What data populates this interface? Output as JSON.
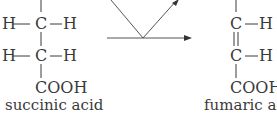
{
  "left_molecule": {
    "row1": {
      "left": "H",
      "center": "C",
      "right": "H"
    },
    "row2": {
      "left": "H",
      "center": "C",
      "right": "H"
    },
    "bottom_group": "COOH",
    "name": "succinic acid"
  },
  "right_molecule": {
    "row1": {
      "center": "C",
      "right": "H"
    },
    "row2": {
      "center": "C",
      "right": "H"
    },
    "bond_between": "double",
    "bottom_group": "COOH",
    "name": "fumaric acid"
  },
  "arrows": {
    "main": "horizontal reaction arrow",
    "coupled": "V-shaped coupled reaction arrow"
  },
  "colors": {
    "ink": "#3a3a3a",
    "arrow": "#555555"
  }
}
